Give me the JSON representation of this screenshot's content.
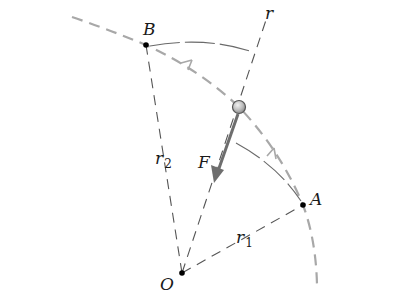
{
  "diagram": {
    "title": "",
    "points": {
      "O": {
        "label": "O",
        "x": 182,
        "y": 273
      },
      "A": {
        "label": "A",
        "x": 303,
        "y": 205
      },
      "B": {
        "label": "B",
        "x": 146,
        "y": 45
      }
    },
    "labels": {
      "r": "r",
      "r1_base": "r",
      "r1_sub": "1",
      "r2_base": "r",
      "r2_sub": "2",
      "F": "F"
    },
    "particle": {
      "x": 239,
      "y": 107,
      "radius": 6
    },
    "force_arrow": {
      "from": [
        238,
        114
      ],
      "to": [
        215,
        180
      ]
    },
    "colors": {
      "path": "#a8a8a8",
      "radial": "#555555",
      "arc": "#6a6a6a",
      "arrow": "#6e6e6e",
      "point": "#000000",
      "particle_fill": "#c9c9c9",
      "particle_stroke": "#555555"
    }
  }
}
